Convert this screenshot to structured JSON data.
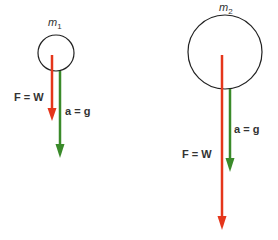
{
  "diagram": {
    "colors": {
      "force": "#e5361b",
      "acceleration": "#3a8a2a",
      "outline": "#222222",
      "text": "#333333"
    },
    "bodies": [
      {
        "id": "body-1",
        "mass_label": "m",
        "mass_subscript": "1",
        "force_label": "F = W",
        "acceleration_label": "a = g",
        "size": "small"
      },
      {
        "id": "body-2",
        "mass_label": "m",
        "mass_subscript": "2",
        "force_label": "F = W",
        "acceleration_label": "a = g",
        "size": "large"
      }
    ]
  }
}
